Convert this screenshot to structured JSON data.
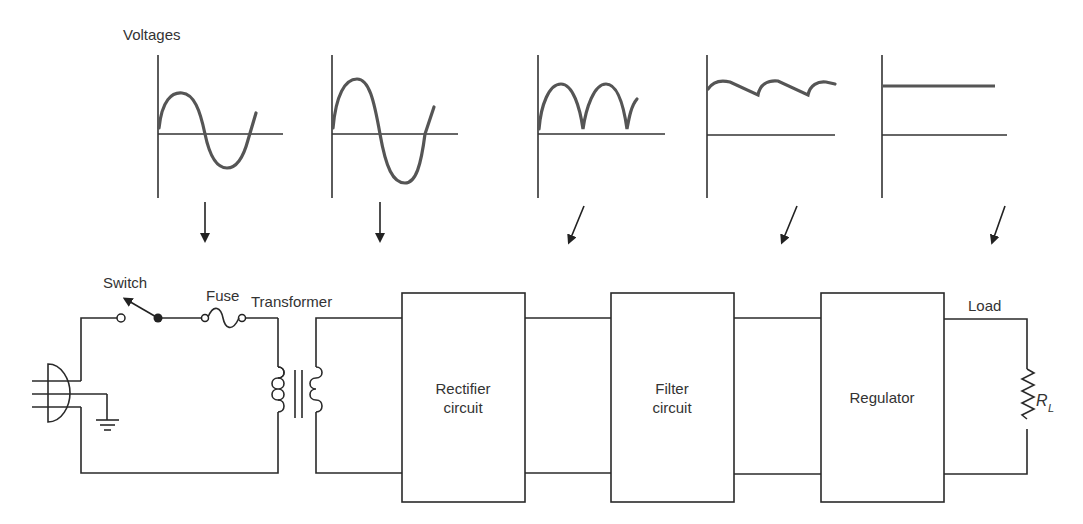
{
  "diagram": {
    "voltages_label": "Voltages",
    "waveforms": [
      {
        "name": "ac-input",
        "label": "AC input (sine)"
      },
      {
        "name": "transformer-output",
        "label": "Stepped sine"
      },
      {
        "name": "rectified",
        "label": "Full-wave rectified"
      },
      {
        "name": "filtered",
        "label": "Ripple DC"
      },
      {
        "name": "regulated",
        "label": "Regulated DC"
      }
    ],
    "components": {
      "switch": "Switch",
      "fuse": "Fuse",
      "transformer": "Transformer",
      "load": "Load",
      "load_resistor": "R",
      "load_resistor_sub": "L"
    },
    "blocks": [
      {
        "line1": "Rectifier",
        "line2": "circuit"
      },
      {
        "line1": "Filter",
        "line2": "circuit"
      },
      {
        "line1": "Regulator",
        "line2": ""
      }
    ],
    "colors": {
      "line": "#2a2a2a",
      "wave": "#555555",
      "text": "#333333"
    }
  }
}
